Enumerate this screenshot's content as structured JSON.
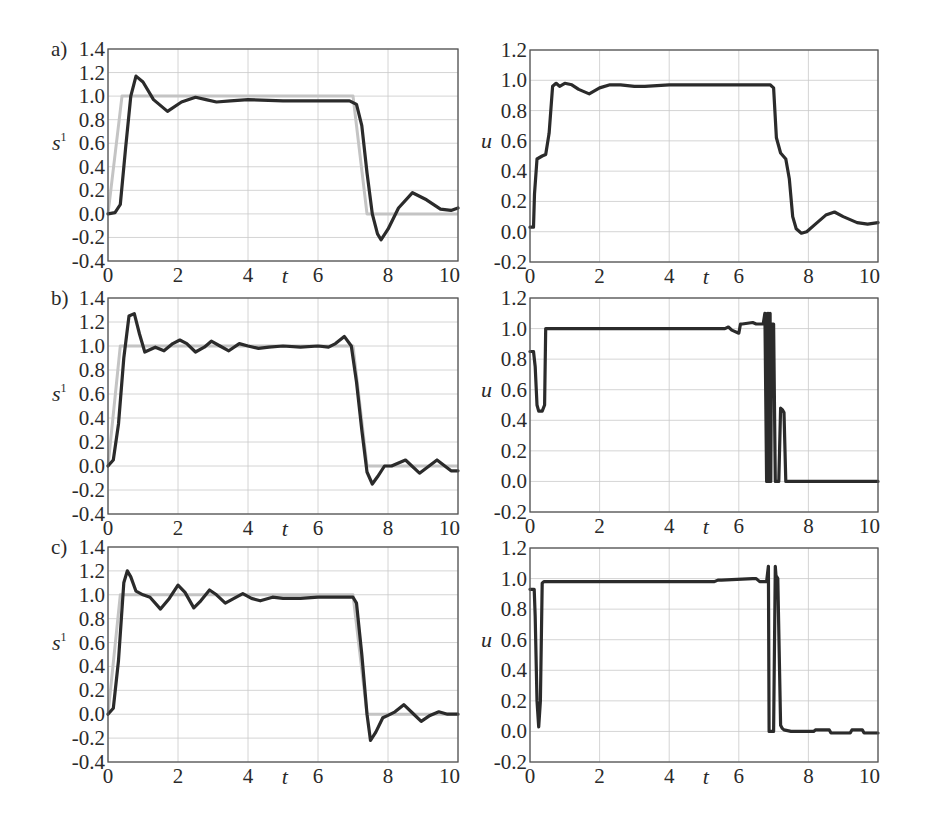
{
  "figure": {
    "panels_layout": "3 rows x 2 columns",
    "row_labels": [
      "a)",
      "b)",
      "c)"
    ],
    "left_ylabel": "s",
    "left_ylabel_sup": "1",
    "right_ylabel": "u",
    "xlabel": "t"
  },
  "chart_data": [
    {
      "id": "a-left",
      "type": "line",
      "panel_label": "a)",
      "xlabel": "t",
      "ylabel": "s^1",
      "xlim": [
        0,
        10
      ],
      "ylim": [
        -0.4,
        1.4
      ],
      "xticks": [
        "0",
        "2",
        "4",
        "6",
        "8",
        "10"
      ],
      "yticks": [
        "-0.4",
        "-0.2",
        "0.0",
        "0.2",
        "0.4",
        "0.6",
        "0.8",
        "1.0",
        "1.2",
        "1.4"
      ],
      "grid": true,
      "series": [
        {
          "name": "reference",
          "color": "#c4c4c4",
          "x": [
            0,
            0.4,
            7.0,
            7.4,
            10
          ],
          "y": [
            0,
            1.0,
            1.0,
            0,
            0
          ]
        },
        {
          "name": "response",
          "color": "#2b2b2b",
          "x": [
            0,
            0.2,
            0.35,
            0.5,
            0.65,
            0.8,
            1.0,
            1.3,
            1.7,
            2.1,
            2.5,
            2.8,
            3.1,
            3.5,
            4.0,
            5.0,
            6.0,
            6.9,
            7.1,
            7.25,
            7.4,
            7.55,
            7.7,
            7.8,
            8.0,
            8.3,
            8.7,
            9.1,
            9.5,
            9.8,
            10
          ],
          "y": [
            0,
            0.01,
            0.08,
            0.55,
            1.0,
            1.17,
            1.12,
            0.97,
            0.87,
            0.95,
            0.99,
            0.97,
            0.95,
            0.96,
            0.97,
            0.96,
            0.96,
            0.96,
            0.93,
            0.75,
            0.35,
            0.0,
            -0.17,
            -0.22,
            -0.13,
            0.05,
            0.18,
            0.12,
            0.04,
            0.03,
            0.05
          ]
        }
      ]
    },
    {
      "id": "a-right",
      "type": "line",
      "panel_label": "a)",
      "xlabel": "t",
      "ylabel": "u",
      "xlim": [
        0,
        10
      ],
      "ylim": [
        -0.2,
        1.2
      ],
      "xticks": [
        "0",
        "2",
        "4",
        "6",
        "8",
        "10"
      ],
      "yticks": [
        "-0.2",
        "0.0",
        "0.2",
        "0.4",
        "0.6",
        "0.8",
        "1.0",
        "1.2"
      ],
      "grid": true,
      "series": [
        {
          "name": "control",
          "color": "#2b2b2b",
          "x": [
            0,
            0.1,
            0.13,
            0.2,
            0.35,
            0.45,
            0.55,
            0.65,
            0.75,
            0.85,
            1.0,
            1.2,
            1.4,
            1.7,
            2.0,
            2.3,
            2.6,
            3.0,
            3.3,
            4.0,
            5.0,
            6.0,
            6.9,
            7.0,
            7.08,
            7.2,
            7.35,
            7.45,
            7.55,
            7.65,
            7.8,
            7.95,
            8.2,
            8.5,
            8.75,
            9.0,
            9.4,
            9.7,
            10
          ],
          "y": [
            0.03,
            0.03,
            0.25,
            0.48,
            0.5,
            0.51,
            0.65,
            0.96,
            0.98,
            0.96,
            0.98,
            0.97,
            0.94,
            0.91,
            0.95,
            0.97,
            0.97,
            0.96,
            0.96,
            0.97,
            0.97,
            0.97,
            0.97,
            0.95,
            0.62,
            0.52,
            0.48,
            0.35,
            0.1,
            0.02,
            -0.01,
            0.0,
            0.05,
            0.11,
            0.13,
            0.1,
            0.06,
            0.05,
            0.06
          ]
        }
      ]
    },
    {
      "id": "b-left",
      "type": "line",
      "panel_label": "b)",
      "xlabel": "t",
      "ylabel": "s^1",
      "xlim": [
        0,
        10
      ],
      "ylim": [
        -0.4,
        1.4
      ],
      "xticks": [
        "0",
        "2",
        "4",
        "6",
        "8",
        "10"
      ],
      "yticks": [
        "-0.4",
        "-0.2",
        "0.0",
        "0.2",
        "0.4",
        "0.6",
        "0.8",
        "1.0",
        "1.2",
        "1.4"
      ],
      "grid": true,
      "series": [
        {
          "name": "reference",
          "color": "#c4c4c4",
          "x": [
            0,
            0.35,
            7.0,
            7.4,
            10
          ],
          "y": [
            0,
            1.0,
            1.0,
            0,
            0
          ]
        },
        {
          "name": "response",
          "color": "#2b2b2b",
          "x": [
            0,
            0.15,
            0.3,
            0.45,
            0.6,
            0.75,
            0.9,
            1.05,
            1.35,
            1.6,
            1.85,
            2.05,
            2.25,
            2.5,
            2.75,
            2.95,
            3.2,
            3.45,
            3.75,
            4.0,
            4.3,
            4.6,
            5.0,
            5.5,
            6.0,
            6.3,
            6.5,
            6.75,
            6.95,
            7.1,
            7.25,
            7.4,
            7.55,
            7.7,
            7.9,
            8.1,
            8.5,
            8.9,
            9.4,
            9.8,
            10
          ],
          "y": [
            0,
            0.05,
            0.35,
            0.9,
            1.25,
            1.27,
            1.1,
            0.95,
            0.99,
            0.96,
            1.02,
            1.05,
            1.02,
            0.95,
            0.99,
            1.04,
            1.0,
            0.96,
            1.02,
            1.0,
            0.98,
            0.99,
            1.0,
            0.99,
            1.0,
            0.99,
            1.02,
            1.08,
            1.0,
            0.7,
            0.3,
            -0.05,
            -0.15,
            -0.09,
            0.0,
            0.0,
            0.05,
            -0.06,
            0.05,
            -0.04,
            -0.04
          ]
        }
      ]
    },
    {
      "id": "b-right",
      "type": "line",
      "panel_label": "b)",
      "xlabel": "t",
      "ylabel": "u",
      "xlim": [
        0,
        10
      ],
      "ylim": [
        -0.2,
        1.2
      ],
      "xticks": [
        "0",
        "2",
        "4",
        "6",
        "8",
        "10"
      ],
      "yticks": [
        "-0.2",
        "0.0",
        "0.2",
        "0.4",
        "0.6",
        "0.8",
        "1.0",
        "1.2"
      ],
      "grid": true,
      "series": [
        {
          "name": "control",
          "color": "#2b2b2b",
          "x": [
            0,
            0.1,
            0.15,
            0.2,
            0.25,
            0.3,
            0.35,
            0.42,
            0.45,
            0.55,
            1.0,
            3.0,
            5.0,
            5.6,
            5.7,
            5.8,
            6.0,
            6.05,
            6.1,
            6.4,
            6.5,
            6.7,
            6.75,
            6.8,
            6.82,
            6.84,
            6.86,
            6.88,
            6.9,
            6.92,
            6.94,
            6.96,
            6.98,
            7.0,
            7.05,
            7.1,
            7.15,
            7.2,
            7.25,
            7.3,
            7.35,
            7.4,
            7.45,
            7.5,
            10
          ],
          "y": [
            0.85,
            0.85,
            0.75,
            0.5,
            0.46,
            0.46,
            0.46,
            0.5,
            1.0,
            1.0,
            1.0,
            1.0,
            1.0,
            1.0,
            1.01,
            0.99,
            0.97,
            1.03,
            1.03,
            1.04,
            1.03,
            1.03,
            1.1,
            0.0,
            1.1,
            0.0,
            1.1,
            0.0,
            1.1,
            0.0,
            1.03,
            1.03,
            1.03,
            1.03,
            0.0,
            0.0,
            0.0,
            0.48,
            0.47,
            0.45,
            0.0,
            0.0,
            0.0,
            0.0,
            0.0
          ]
        }
      ]
    },
    {
      "id": "c-left",
      "type": "line",
      "panel_label": "c)",
      "xlabel": "t",
      "ylabel": "s^1",
      "xlim": [
        0,
        10
      ],
      "ylim": [
        -0.4,
        1.4
      ],
      "xticks": [
        "0",
        "2",
        "4",
        "6",
        "8",
        "10"
      ],
      "yticks": [
        "-0.4",
        "-0.2",
        "0.0",
        "0.2",
        "0.4",
        "0.6",
        "0.8",
        "1.0",
        "1.2",
        "1.4"
      ],
      "grid": true,
      "series": [
        {
          "name": "reference",
          "color": "#c4c4c4",
          "x": [
            0,
            0.35,
            7.0,
            7.4,
            10
          ],
          "y": [
            0,
            1.0,
            1.0,
            0,
            0
          ]
        },
        {
          "name": "response",
          "color": "#2b2b2b",
          "x": [
            0,
            0.15,
            0.3,
            0.45,
            0.55,
            0.65,
            0.8,
            1.0,
            1.2,
            1.5,
            1.75,
            2.0,
            2.2,
            2.45,
            2.65,
            2.9,
            3.1,
            3.35,
            3.6,
            3.85,
            4.1,
            4.35,
            4.7,
            5.0,
            5.5,
            6.0,
            6.5,
            7.0,
            7.1,
            7.25,
            7.4,
            7.5,
            7.65,
            7.85,
            8.0,
            8.2,
            8.45,
            8.7,
            8.95,
            9.2,
            9.45,
            9.7,
            10
          ],
          "y": [
            0,
            0.05,
            0.45,
            1.1,
            1.2,
            1.15,
            1.03,
            1.0,
            0.98,
            0.88,
            0.97,
            1.08,
            1.02,
            0.89,
            0.95,
            1.04,
            1.0,
            0.93,
            0.97,
            1.01,
            0.97,
            0.95,
            0.98,
            0.97,
            0.97,
            0.98,
            0.98,
            0.98,
            0.93,
            0.5,
            0.0,
            -0.22,
            -0.15,
            -0.03,
            -0.01,
            0.02,
            0.08,
            0.01,
            -0.06,
            -0.01,
            0.02,
            0.0,
            0.0
          ]
        }
      ]
    },
    {
      "id": "c-right",
      "type": "line",
      "panel_label": "c)",
      "xlabel": "t",
      "ylabel": "u",
      "xlim": [
        0,
        10
      ],
      "ylim": [
        -0.2,
        1.2
      ],
      "xticks": [
        "0",
        "2",
        "4",
        "6",
        "8",
        "10"
      ],
      "yticks": [
        "-0.2",
        "0.0",
        "0.2",
        "0.4",
        "0.6",
        "0.8",
        "1.0",
        "1.2"
      ],
      "grid": true,
      "series": [
        {
          "name": "control",
          "color": "#2b2b2b",
          "x": [
            0,
            0.12,
            0.15,
            0.2,
            0.25,
            0.3,
            0.35,
            0.4,
            3.0,
            5.3,
            5.4,
            5.5,
            6.4,
            6.5,
            6.6,
            6.8,
            6.85,
            6.87,
            6.95,
            7.0,
            7.05,
            7.07,
            7.12,
            7.2,
            7.25,
            7.3,
            7.5,
            7.8,
            8.0,
            8.15,
            8.2,
            8.6,
            8.65,
            9.2,
            9.25,
            9.55,
            9.6,
            10
          ],
          "y": [
            0.93,
            0.93,
            0.75,
            0.2,
            0.03,
            0.2,
            0.97,
            0.98,
            0.98,
            0.98,
            0.99,
            0.99,
            1.0,
            1.0,
            0.98,
            0.98,
            1.08,
            0.0,
            0.0,
            0.0,
            1.08,
            1.02,
            1.0,
            0.04,
            0.02,
            0.01,
            0.0,
            0.0,
            0.0,
            0.0,
            0.01,
            0.01,
            -0.01,
            -0.01,
            0.01,
            0.01,
            -0.01,
            -0.01
          ]
        }
      ]
    }
  ]
}
